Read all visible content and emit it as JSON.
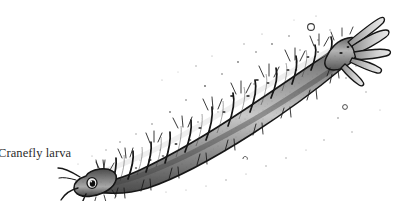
{
  "figure": {
    "caption": "Cranefly larva",
    "subject": "cranefly larva",
    "medium": "pen-and-ink stipple and hatching illustration",
    "background_color": "#ffffff",
    "ink_color": "#1a1a1a",
    "body_fill_color": "#9a9a9a",
    "body_shadow_color": "#5d5d5d",
    "body_highlight_color": "#d8d8d8",
    "orientation": "diagonal, head at lower-left, tail at upper-right",
    "anatomy": {
      "head_label": "head",
      "eye_label": "eye-spot",
      "palps_label": "antennae-palps",
      "body_label": "segmented-abdomen",
      "tail_label": "anal-papillae",
      "bristles_label": "setae-bristles",
      "segment_count": 12
    },
    "geometry": {
      "head_x": 88,
      "head_y": 172,
      "tail_x": 356,
      "tail_y": 42,
      "segments": [
        {
          "cx": 100,
          "cy": 168,
          "w": 17,
          "h": 27,
          "rot": -26,
          "tone": 0.46
        },
        {
          "cx": 117,
          "cy": 160,
          "w": 15,
          "h": 31,
          "rot": -26,
          "tone": 0.42
        },
        {
          "cx": 133,
          "cy": 153,
          "w": 16,
          "h": 34,
          "rot": -27,
          "tone": 0.44
        },
        {
          "cx": 150,
          "cy": 145,
          "w": 17,
          "h": 37,
          "rot": -28,
          "tone": 0.4
        },
        {
          "cx": 168,
          "cy": 136,
          "w": 18,
          "h": 40,
          "rot": -28,
          "tone": 0.38
        },
        {
          "cx": 187,
          "cy": 127,
          "w": 19,
          "h": 43,
          "rot": -29,
          "tone": 0.36
        },
        {
          "cx": 207,
          "cy": 117,
          "w": 20,
          "h": 45,
          "rot": -29,
          "tone": 0.34
        },
        {
          "cx": 228,
          "cy": 106,
          "w": 21,
          "h": 46,
          "rot": -30,
          "tone": 0.33
        },
        {
          "cx": 250,
          "cy": 95,
          "w": 21,
          "h": 46,
          "rot": -30,
          "tone": 0.34
        },
        {
          "cx": 272,
          "cy": 84,
          "w": 21,
          "h": 44,
          "rot": -30,
          "tone": 0.36
        },
        {
          "cx": 293,
          "cy": 72,
          "w": 20,
          "h": 41,
          "rot": -31,
          "tone": 0.38
        },
        {
          "cx": 313,
          "cy": 61,
          "w": 19,
          "h": 37,
          "rot": -31,
          "tone": 0.4
        }
      ],
      "tail_lobes": [
        {
          "x1": 340,
          "y1": 44,
          "x2": 378,
          "y2": 22,
          "w": 5
        },
        {
          "x1": 342,
          "y1": 48,
          "x2": 384,
          "y2": 34,
          "w": 5
        },
        {
          "x1": 344,
          "y1": 53,
          "x2": 386,
          "y2": 50,
          "w": 5
        },
        {
          "x1": 343,
          "y1": 58,
          "x2": 380,
          "y2": 62,
          "w": 5
        },
        {
          "x1": 339,
          "y1": 61,
          "x2": 368,
          "y2": 72,
          "w": 4
        }
      ],
      "palps": [
        {
          "x1": 88,
          "y1": 176,
          "x2": 66,
          "y2": 168
        },
        {
          "x1": 88,
          "y1": 182,
          "x2": 70,
          "y2": 190
        },
        {
          "x1": 91,
          "y1": 185,
          "x2": 82,
          "y2": 196
        }
      ],
      "bubbles": [
        {
          "cx": 311,
          "cy": 27,
          "r": 3.6
        },
        {
          "cx": 345,
          "cy": 107,
          "r": 2.6
        },
        {
          "cx": 245,
          "cy": 159,
          "r": 2.2
        }
      ]
    }
  }
}
